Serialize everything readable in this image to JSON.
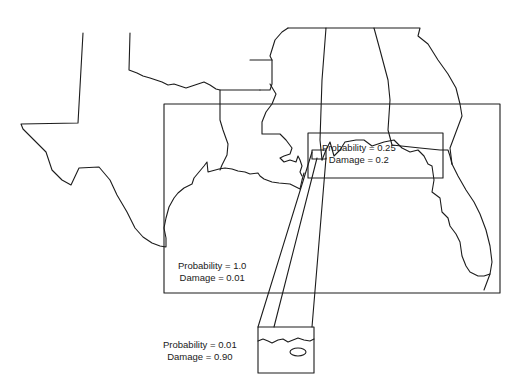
{
  "figure": {
    "regions": [
      {
        "id": "region-large",
        "probability_label": "Probability = 1.0",
        "damage_label": "Damage = 0.01"
      },
      {
        "id": "region-medium",
        "probability_label": "Probability = 0.25",
        "damage_label": "Damage = 0.2"
      },
      {
        "id": "region-small",
        "probability_label": "Probability = 0.01",
        "damage_label": "Damage = 0.90"
      }
    ],
    "colors": {
      "line": "#1c1c1c",
      "background": "#ffffff"
    }
  }
}
